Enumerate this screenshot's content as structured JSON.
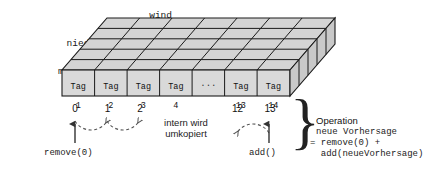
{
  "diagram": {
    "dimension_labels": [
      "wind",
      "luft",
      "niederschlag",
      "maxTemp",
      "minTemp"
    ],
    "cells": [
      {
        "line1": "Tag",
        "line2": "1"
      },
      {
        "line1": "Tag",
        "line2": "2"
      },
      {
        "line1": "Tag",
        "line2": "3"
      },
      {
        "line1": "Tag",
        "line2": "4"
      },
      {
        "line1": "...",
        "line2": ""
      },
      {
        "line1": "Tag",
        "line2": "13"
      },
      {
        "line1": "Tag",
        "line2": "14"
      }
    ],
    "indices": [
      {
        "label": "0",
        "col": 0
      },
      {
        "label": "1",
        "col": 1
      },
      {
        "label": "2",
        "col": 2
      },
      {
        "label": "12",
        "col": 5
      },
      {
        "label": "13",
        "col": 6
      }
    ],
    "remove_label": "remove(0)",
    "add_label": "add()",
    "center_note": "intern wird\numkopiert",
    "operation": {
      "title": "Operation",
      "code_line1": "neue Vorhersage",
      "code_line2": "= remove(0) +",
      "code_line3": "  add(neueVorhersage)"
    },
    "colors": {
      "face_fill": "#d9d9d9",
      "top_fill": "#d4d4d4",
      "side_fill": "#c9c9c9",
      "stroke": "#1a1a1a",
      "text": "#111111",
      "dashed": "#555555"
    }
  }
}
